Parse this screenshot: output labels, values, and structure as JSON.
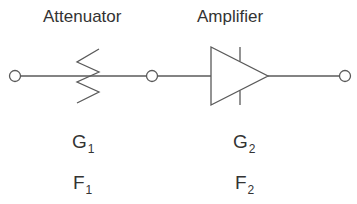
{
  "diagram": {
    "stages": [
      {
        "name": "Attenuator",
        "symbol": "variable-resistor",
        "gain_label": {
          "base": "G",
          "sub": "1"
        },
        "noise_label": {
          "base": "F",
          "sub": "1"
        }
      },
      {
        "name": "Amplifier",
        "symbol": "triangle-amplifier",
        "gain_label": {
          "base": "G",
          "sub": "2"
        },
        "noise_label": {
          "base": "F",
          "sub": "2"
        }
      }
    ],
    "terminals": [
      "input",
      "interstage",
      "output"
    ],
    "colors": {
      "line": "#5a5a5a",
      "text": "#333333",
      "background": "#ffffff"
    }
  }
}
